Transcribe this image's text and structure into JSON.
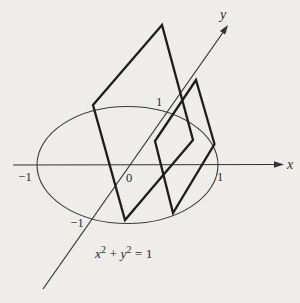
{
  "diagram": {
    "description_colors": {
      "paper": "#f1efec",
      "ink": "#2b2b2b"
    },
    "axes": {
      "x_label": "x",
      "y_label": "y"
    },
    "ticks": {
      "x_neg_one": "−1",
      "origin": "0",
      "x_one": "1",
      "y_one": "1",
      "y_neg_one": "−1"
    },
    "equation": {
      "x_var": "x",
      "x_exp": "2",
      "plus": " + ",
      "y_var": "y",
      "y_exp": "2",
      "equals": " = 1"
    }
  }
}
